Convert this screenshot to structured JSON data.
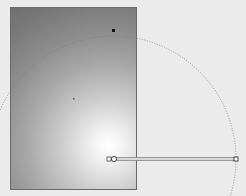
{
  "canvas": {
    "background": "#ebebeb"
  },
  "shape": {
    "type": "rectangle",
    "fill": "radial-gradient",
    "gradient_stops": [
      {
        "offset": "0%",
        "color": "#ffffff"
      },
      {
        "offset": "100%",
        "color": "#707070"
      }
    ],
    "stroke": "#6a6a6a"
  },
  "gradient_tool": {
    "center": {
      "x": 113,
      "y": 159
    },
    "radius_handle": {
      "x": 236,
      "y": 159
    },
    "focus_handle": {
      "x": 113,
      "y": 30
    },
    "radius": 123,
    "guide_color": "#7a7a7a"
  }
}
